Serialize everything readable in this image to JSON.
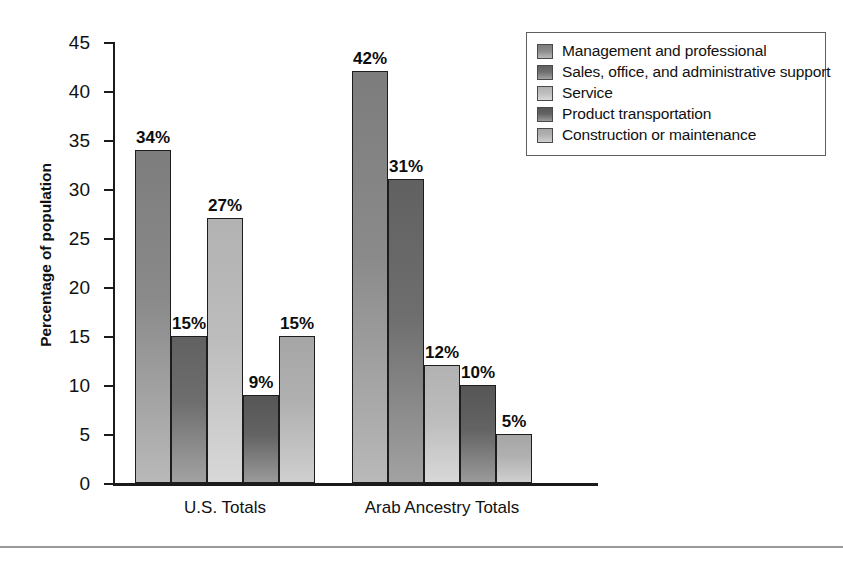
{
  "chart_data": {
    "type": "bar",
    "title": "",
    "subtitle": "",
    "xlabel": "",
    "ylabel": "Percentage of population",
    "ylim": [
      0,
      45
    ],
    "ytick_labels": [
      "45",
      "40",
      "35",
      "30",
      "25",
      "20",
      "15",
      "10",
      "5",
      "0"
    ],
    "ytick_values": [
      45,
      40,
      35,
      30,
      25,
      20,
      15,
      10,
      5,
      0
    ],
    "grid": false,
    "legend_position": "top-right",
    "value_label_suffix": "%",
    "categories": [
      "U.S. Totals",
      "Arab Ancestry Totals"
    ],
    "series": [
      {
        "name": "Management and professional",
        "color": "#8a8a8a",
        "values": [
          34,
          42
        ],
        "value_labels": [
          "34%",
          "42%"
        ]
      },
      {
        "name": "Sales, office, and administrative support",
        "color": "#6e6e6e",
        "values": [
          15,
          31
        ],
        "value_labels": [
          "15%",
          "31%"
        ]
      },
      {
        "name": "Service",
        "color": "#bcbcbc",
        "values": [
          27,
          12
        ],
        "value_labels": [
          "27%",
          "12%"
        ]
      },
      {
        "name": "Product transportation",
        "color": "#636363",
        "values": [
          9,
          10
        ],
        "value_labels": [
          "9%",
          "10%"
        ]
      },
      {
        "name": "Construction or maintenance",
        "color": "#b0b0b0",
        "values": [
          15,
          5
        ],
        "value_labels": [
          "15%",
          "5%"
        ]
      }
    ]
  }
}
